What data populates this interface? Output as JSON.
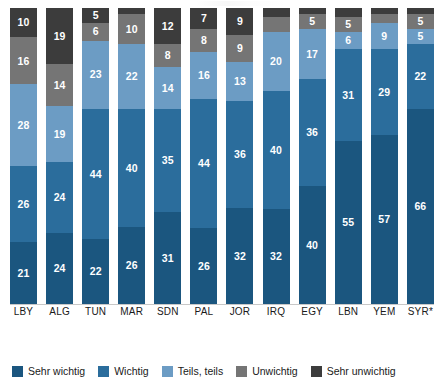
{
  "chart_data": {
    "type": "bar",
    "subtype": "stacked-bar-100",
    "title": "",
    "subtitle": "",
    "xlabel": "",
    "ylabel": "",
    "ylim": [
      0,
      100
    ],
    "grid": false,
    "legend_position": "bottom",
    "stack_order_bottom_to_top": [
      "Sehr wichtig",
      "Wichtig",
      "Teils, teils",
      "Unwichtig",
      "Sehr unwichtig"
    ],
    "categories": [
      "LBY",
      "ALG",
      "TUN",
      "MAR",
      "SDN",
      "PAL",
      "JOR",
      "IRQ",
      "EGY",
      "LBN",
      "YEM",
      "SYR*"
    ],
    "series": [
      {
        "name": "Sehr wichtig",
        "color": "#1b567f",
        "values": [
          21,
          24,
          22,
          26,
          31,
          26,
          32,
          32,
          40,
          55,
          57,
          66
        ],
        "labels": [
          "21",
          "24",
          "22",
          "26",
          "31",
          "26",
          "32",
          "32",
          "40",
          "55",
          "57",
          "66"
        ]
      },
      {
        "name": "Wichtig",
        "color": "#2b6d9c",
        "values": [
          26,
          24,
          44,
          40,
          35,
          44,
          36,
          40,
          36,
          31,
          29,
          22
        ],
        "labels": [
          "26",
          "24",
          "44",
          "40",
          "35",
          "44",
          "36",
          "40",
          "36",
          "31",
          "29",
          "22"
        ]
      },
      {
        "name": "Teils, teils",
        "color": "#6c9cc4",
        "values": [
          28,
          19,
          23,
          22,
          14,
          16,
          13,
          20,
          17,
          6,
          9,
          5
        ],
        "labels": [
          "28",
          "19",
          "23",
          "22",
          "14",
          "16",
          "13",
          "20",
          "17",
          "6",
          "9",
          "5"
        ]
      },
      {
        "name": "Unwichtig",
        "color": "#757575",
        "values": [
          16,
          14,
          6,
          10,
          8,
          8,
          9,
          5,
          5,
          5,
          3,
          5
        ],
        "labels": [
          "16",
          "14",
          "6",
          "10",
          "8",
          "8",
          "9",
          "",
          "5",
          "5",
          "",
          "5"
        ]
      },
      {
        "name": "Sehr unwichtig",
        "color": "#3c3c3c",
        "values": [
          10,
          19,
          5,
          2,
          12,
          7,
          9,
          3,
          2,
          3,
          2,
          2
        ],
        "labels": [
          "10",
          "19",
          "5",
          "",
          "12",
          "7",
          "9",
          "",
          "",
          "",
          "",
          ""
        ]
      }
    ]
  },
  "legend": {
    "items": [
      {
        "label": "Sehr wichtig",
        "color": "#1b567f"
      },
      {
        "label": "Wichtig",
        "color": "#2b6d9c"
      },
      {
        "label": "Teils, teils",
        "color": "#6c9cc4"
      },
      {
        "label": "Unwichtig",
        "color": "#757575"
      },
      {
        "label": "Sehr unwichtig",
        "color": "#3c3c3c"
      }
    ]
  }
}
